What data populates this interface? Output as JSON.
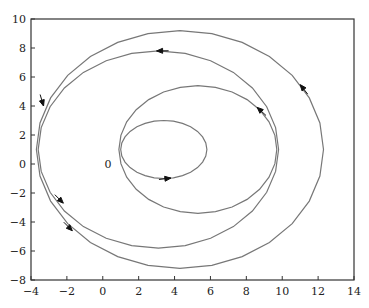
{
  "chart_data": {
    "type": "line",
    "title": "",
    "xlabel": "",
    "ylabel": "",
    "xlim": [
      -4,
      14
    ],
    "ylim": [
      -8,
      10
    ],
    "xticks": [
      -4,
      -2,
      0,
      2,
      4,
      6,
      8,
      10,
      12,
      14
    ],
    "yticks": [
      -8,
      -6,
      -4,
      -2,
      0,
      2,
      4,
      6,
      8,
      10
    ],
    "grid": false,
    "legend": null,
    "annotations": [
      {
        "text": "0",
        "x": 0.1,
        "y": 0
      }
    ],
    "series": [
      {
        "name": "orbit-1",
        "shape": "closed-curve",
        "center": [
          3.4,
          1.0
        ],
        "rx": 2.4,
        "ry": 2.0,
        "arrow_at": [
          3.8,
          -1.0
        ],
        "direction": "counterclockwise"
      },
      {
        "name": "orbit-2",
        "shape": "closed-curve",
        "center": [
          5.3,
          1.0
        ],
        "rx": 4.4,
        "ry": 4.4,
        "arrow_at": [
          8.6,
          3.9
        ],
        "direction": "counterclockwise"
      },
      {
        "name": "orbit-3",
        "shape": "closed-curve",
        "center": [
          3.1,
          1.0
        ],
        "rx": 6.7,
        "ry": 6.8,
        "arrow_at": [
          3.0,
          7.8
        ],
        "direction": "counterclockwise"
      },
      {
        "name": "orbit-4",
        "shape": "closed-curve",
        "center": [
          4.3,
          1.0
        ],
        "rx": 8.0,
        "ry": 8.2,
        "arrow_at": [
          11.2,
          5.6
        ],
        "direction": "counterclockwise"
      }
    ],
    "extra_arrows": [
      {
        "at": [
          -3.3,
          4.0
        ],
        "dir": "down"
      },
      {
        "at": [
          -2.2,
          -2.7
        ],
        "dir": "down-right"
      },
      {
        "at": [
          -1.7,
          -4.6
        ],
        "dir": "down-right"
      }
    ]
  }
}
